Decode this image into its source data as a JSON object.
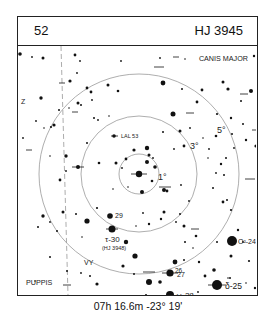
{
  "header": {
    "chart_number": "52",
    "object_id": "HJ 3945"
  },
  "constellations": [
    "CANIS MAJOR",
    "PUPPIS"
  ],
  "rings": [
    {
      "label": "1°",
      "radius": 20
    },
    {
      "label": "3°",
      "radius": 58
    },
    {
      "label": "5°",
      "radius": 100
    }
  ],
  "labels": {
    "canis_major": "CANIS MAJOR",
    "puppis": "PUPPIS",
    "ring1": "1°",
    "ring3": "3°",
    "ring5": "5°",
    "lal53": "LAL 53",
    "s29": "29",
    "tau30": "τ-30",
    "hj3948": "(HJ 3948)",
    "vy": "VY",
    "s26": "26",
    "s27": "27",
    "omega28": "ω-28",
    "delta25": "δ-25",
    "omicron24": "O²-24",
    "z": "Z"
  },
  "caption": {
    "coordinates": "07h 16.6m  -23° 19'"
  },
  "colors": {
    "ink": "#111111",
    "ring": "#999999",
    "frame": "#222222"
  }
}
